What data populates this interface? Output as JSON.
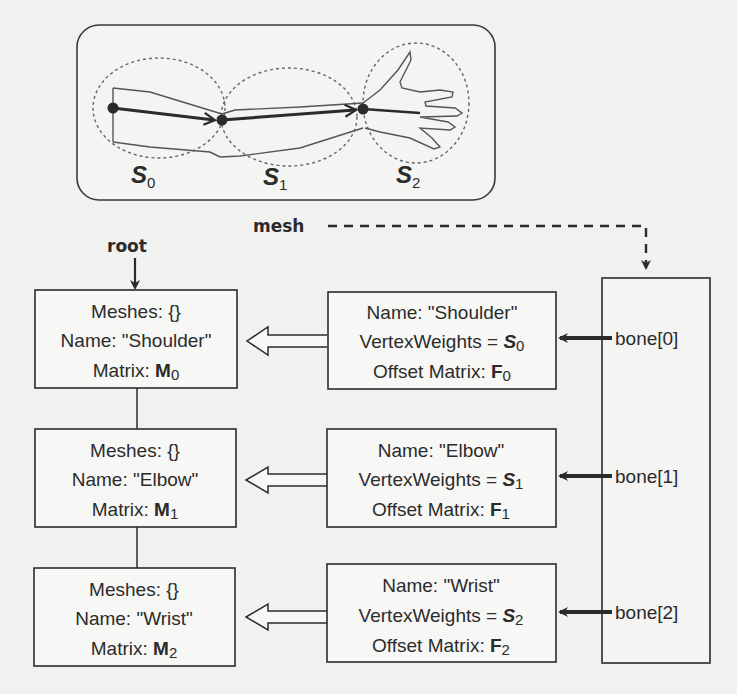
{
  "arm_figure": {
    "segments": [
      {
        "label": "S",
        "sub": "0"
      },
      {
        "label": "S",
        "sub": "1"
      },
      {
        "label": "S",
        "sub": "2"
      }
    ]
  },
  "labels": {
    "root": "root",
    "mesh": "mesh"
  },
  "nodes": [
    {
      "meshes": "Meshes:  {}",
      "name": "Name: \"Shoulder\"",
      "matrix_prefix": "Matrix:  ",
      "matrix_symbol": "M",
      "matrix_sub": "0"
    },
    {
      "meshes": "Meshes:  {}",
      "name": "Name: \"Elbow\"",
      "matrix_prefix": "Matrix:  ",
      "matrix_symbol": "M",
      "matrix_sub": "1"
    },
    {
      "meshes": "Meshes:  {}",
      "name": "Name: \"Wrist\"",
      "matrix_prefix": "Matrix:  ",
      "matrix_symbol": "M",
      "matrix_sub": "2"
    }
  ],
  "bones": [
    {
      "name": "Name: \"Shoulder\"",
      "weights_prefix": "VertexWeights = ",
      "weights_symbol": "S",
      "weights_sub": "0",
      "offset_prefix": "Offset Matrix:  ",
      "offset_symbol": "F",
      "offset_sub": "0"
    },
    {
      "name": "Name: \"Elbow\"",
      "weights_prefix": "VertexWeights = ",
      "weights_symbol": "S",
      "weights_sub": "1",
      "offset_prefix": "Offset Matrix:  ",
      "offset_symbol": "F",
      "offset_sub": "1"
    },
    {
      "name": "Name: \"Wrist\"",
      "weights_prefix": "VertexWeights = ",
      "weights_symbol": "S",
      "weights_sub": "2",
      "offset_prefix": "Offset Matrix:  ",
      "offset_symbol": "F",
      "offset_sub": "2"
    }
  ],
  "mesh_bones": [
    "bone[0]",
    "bone[1]",
    "bone[2]"
  ],
  "colors": {
    "background": "#f1f1ef",
    "stroke": "#2b2b2b",
    "dashed": "#555555"
  }
}
